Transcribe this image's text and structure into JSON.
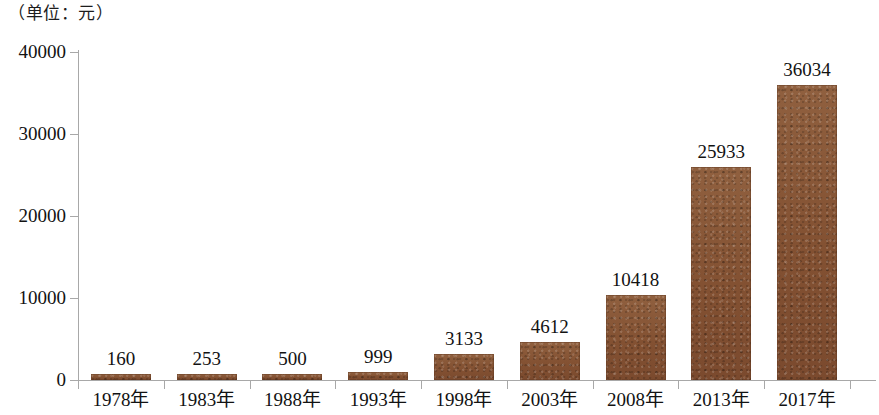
{
  "caption": {
    "unit_note": "（单位：元）"
  },
  "chart_data": {
    "type": "bar",
    "title": "",
    "subtitle": "",
    "xlabel": "",
    "ylabel": "",
    "unit_note": "（单位：元）",
    "categories": [
      "1978年",
      "1983年",
      "1988年",
      "1993年",
      "1998年",
      "2003年",
      "2008年",
      "2013年",
      "2017年"
    ],
    "values": [
      160,
      253,
      500,
      999,
      3133,
      4612,
      10418,
      25933,
      36034
    ],
    "value_labels": [
      "160",
      "253",
      "500",
      "999",
      "3133",
      "4612",
      "10418",
      "25933",
      "36034"
    ],
    "ylim": [
      0,
      40000
    ],
    "ytick_values": [
      0,
      10000,
      20000,
      30000,
      40000
    ],
    "ytick_labels": [
      "0",
      "10000",
      "20000",
      "30000",
      "40000"
    ],
    "grid": false,
    "legend": null,
    "legend_position": "none",
    "series": [
      {
        "name": "",
        "values": [
          160,
          253,
          500,
          999,
          3133,
          4612,
          10418,
          25933,
          36034
        ]
      }
    ],
    "colors": {
      "bar_fill": "#8a573a",
      "bar_fill_dark": "#7b4a2e",
      "axis": "#a8a8a8",
      "text": "#121212",
      "background": "#ffffff"
    }
  }
}
